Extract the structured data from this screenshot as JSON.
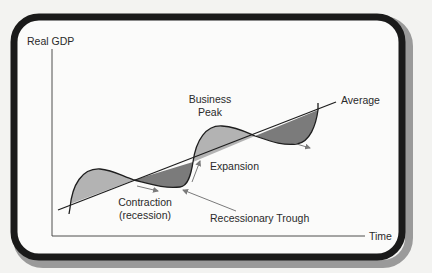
{
  "diagram": {
    "axes": {
      "y_label": "Real GDP",
      "x_label": "Time"
    },
    "trend_label": "Average",
    "labels": {
      "business_peak_line1": "Business",
      "business_peak_line2": "Peak",
      "expansion": "Expansion",
      "contraction_line1": "Contraction",
      "contraction_line2": "(recession)",
      "recessionary_trough": "Recessionary Trough"
    },
    "colors": {
      "background": "#f3f3f1",
      "panel": "#fbfbfa",
      "frame": "#1a1a1a",
      "frame_shadow": "#9a9a9a",
      "above_trend_fill": "#b3b3b3",
      "below_trend_fill": "#7b7b7b",
      "line": "#1e1e1e",
      "arrow": "#7a7a7a"
    },
    "phases": [
      "Expansion above average",
      "Contraction (recession)",
      "Recessionary Trough",
      "Expansion",
      "Business Peak",
      "Contraction",
      "Trough"
    ]
  }
}
